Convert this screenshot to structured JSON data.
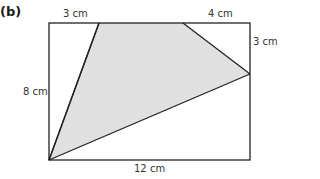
{
  "part_label": "(b)",
  "diagram": {
    "rectangle": {
      "width_label": "12 cm",
      "height_label": "8 cm"
    },
    "top_left_segment_label": "3 cm",
    "top_right_segment_label": "4 cm",
    "right_segment_label": "3 cm",
    "colors": {
      "shade": "#e0e0e0",
      "stroke": "#222222",
      "text": "#333333"
    }
  }
}
